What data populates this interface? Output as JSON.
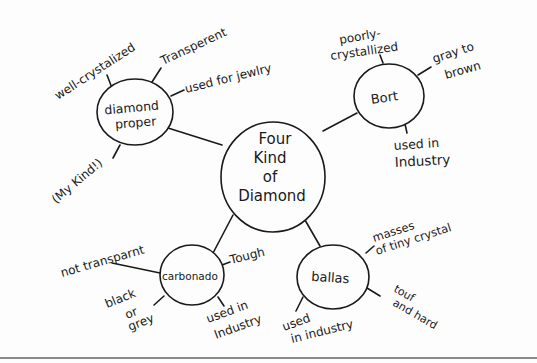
{
  "diagram": {
    "type": "mind-map",
    "center": {
      "id": "center",
      "lines": [
        "Four",
        "Kind",
        "of",
        "Diamond"
      ]
    },
    "nodes": [
      {
        "id": "diamond-proper",
        "lines": [
          "diamond",
          "proper"
        ],
        "attributes": [
          {
            "lines": [
              "well-crystalized"
            ]
          },
          {
            "lines": [
              "Transperent"
            ]
          },
          {
            "lines": [
              "used for jewlry"
            ]
          },
          {
            "lines": [
              "(My Kind!)"
            ]
          }
        ]
      },
      {
        "id": "bort",
        "lines": [
          "Bort"
        ],
        "attributes": [
          {
            "lines": [
              "poorly-",
              "crystallized"
            ]
          },
          {
            "lines": [
              "gray to",
              "brown"
            ]
          },
          {
            "lines": [
              "used in",
              "Industry"
            ]
          }
        ]
      },
      {
        "id": "carbonado",
        "lines": [
          "carbonado"
        ],
        "attributes": [
          {
            "lines": [
              "not transparnt"
            ]
          },
          {
            "lines": [
              "Tough"
            ]
          },
          {
            "lines": [
              "black",
              "or",
              "grey"
            ]
          },
          {
            "lines": [
              "used in",
              "Industry"
            ]
          }
        ]
      },
      {
        "id": "ballas",
        "lines": [
          "ballas"
        ],
        "attributes": [
          {
            "lines": [
              "masses",
              "of tiny crystal"
            ]
          },
          {
            "lines": [
              "touf",
              "and hard"
            ]
          },
          {
            "lines": [
              "used",
              "in industry"
            ]
          }
        ]
      }
    ]
  }
}
